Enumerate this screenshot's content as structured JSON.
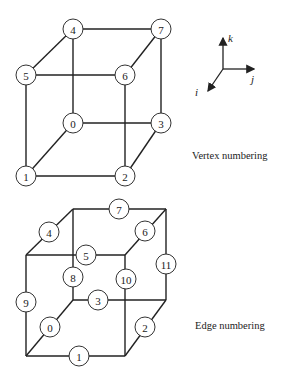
{
  "vertex_diagram": {
    "caption": "Vertex numbering",
    "vertices": [
      {
        "label": "0",
        "x": 73,
        "y": 123
      },
      {
        "label": "1",
        "x": 26,
        "y": 176
      },
      {
        "label": "2",
        "x": 125,
        "y": 176
      },
      {
        "label": "3",
        "x": 161,
        "y": 123
      },
      {
        "label": "4",
        "x": 73,
        "y": 29
      },
      {
        "label": "5",
        "x": 26,
        "y": 75
      },
      {
        "label": "6",
        "x": 125,
        "y": 75
      },
      {
        "label": "7",
        "x": 161,
        "y": 29
      }
    ],
    "edges": [
      [
        0,
        1
      ],
      [
        1,
        2
      ],
      [
        2,
        3
      ],
      [
        3,
        0
      ],
      [
        4,
        5
      ],
      [
        5,
        6
      ],
      [
        6,
        7
      ],
      [
        7,
        4
      ],
      [
        0,
        4
      ],
      [
        1,
        5
      ],
      [
        2,
        6
      ],
      [
        3,
        7
      ]
    ]
  },
  "axes": {
    "k_label": "k",
    "j_label": "j",
    "i_label": "i"
  },
  "edge_diagram": {
    "caption": "Edge numbering",
    "corners": {
      "btl": [
        73,
        209
      ],
      "btr": [
        166,
        209
      ],
      "ftl": [
        26,
        255
      ],
      "ftr": [
        125,
        255
      ],
      "bbl": [
        73,
        300
      ],
      "bbr": [
        166,
        300
      ],
      "fbl": [
        26,
        356
      ],
      "fbr": [
        125,
        356
      ]
    },
    "edge_labels": [
      {
        "label": "0",
        "x": 50,
        "y": 327
      },
      {
        "label": "1",
        "x": 79,
        "y": 356
      },
      {
        "label": "2",
        "x": 145,
        "y": 327
      },
      {
        "label": "3",
        "x": 98,
        "y": 300
      },
      {
        "label": "4",
        "x": 49,
        "y": 232
      },
      {
        "label": "5",
        "x": 86,
        "y": 255
      },
      {
        "label": "6",
        "x": 145,
        "y": 231
      },
      {
        "label": "7",
        "x": 119,
        "y": 209
      },
      {
        "label": "8",
        "x": 73,
        "y": 277
      },
      {
        "label": "9",
        "x": 26,
        "y": 302
      },
      {
        "label": "10",
        "x": 126,
        "y": 279
      },
      {
        "label": "11",
        "x": 166,
        "y": 264
      }
    ]
  }
}
